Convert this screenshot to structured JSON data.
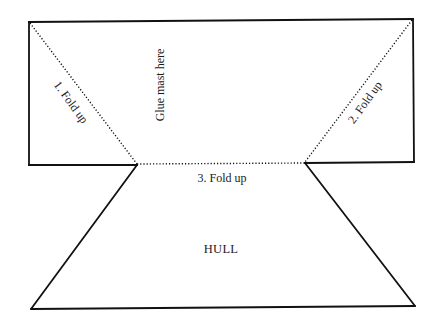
{
  "diagram": {
    "colors": {
      "line": "#111111",
      "background": "#ffffff",
      "text": "#1a1a1a"
    },
    "labels": {
      "glue_mast": "Glue mast here",
      "fold_1": "1. Fold up",
      "fold_2": "2. Fold up",
      "fold_3": "3. Fold up",
      "hull": "HULL"
    },
    "regions": [
      {
        "name": "sail-panel",
        "type": "rectangle",
        "label_key": "glue_mast"
      },
      {
        "name": "hull",
        "type": "trapezoid",
        "label_key": "hull"
      }
    ],
    "fold_lines": [
      {
        "name": "fold-line-1",
        "style": "dotted",
        "label_key": "fold_1"
      },
      {
        "name": "fold-line-2",
        "style": "dotted",
        "label_key": "fold_2"
      },
      {
        "name": "fold-line-3",
        "style": "dotted",
        "label_key": "fold_3"
      }
    ]
  }
}
